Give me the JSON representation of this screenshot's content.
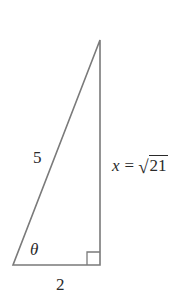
{
  "diagram": {
    "type": "right-triangle",
    "colors": {
      "stroke": "#7a7a7a",
      "text": "#2a2a2a",
      "background": "#ffffff"
    },
    "vertices": {
      "top": [
        100,
        40
      ],
      "bottom_left": [
        13,
        265
      ],
      "bottom_right": [
        100,
        265
      ]
    },
    "right_angle_marker": {
      "corner": "bottom_right",
      "size": 13
    },
    "labels": {
      "hypotenuse": "5",
      "angle": "θ",
      "base": "2",
      "opposite": {
        "variable": "x",
        "equals": "=",
        "radical": "√",
        "radicand": "21"
      }
    }
  }
}
